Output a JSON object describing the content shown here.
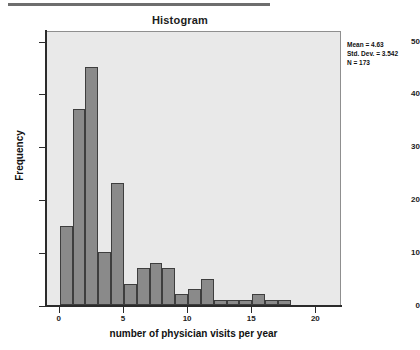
{
  "page": {
    "top_rule": "",
    "bleed_through": [
      "THE ROLE OF THE GROUP OF THE",
      "GROUP",
      "of the patients in the study were",
      "and they were seen in the",
      "clinic at least once during",
      "the year of the survey",
      "PATIENT STUDY RESULTS 2002"
    ]
  },
  "chart_data": {
    "type": "bar",
    "title": "Histogram",
    "xlabel": "number of physician visits per year",
    "ylabel": "Frequency",
    "x": [
      0,
      1,
      2,
      3,
      4,
      5,
      6,
      7,
      8,
      9,
      10,
      11,
      12,
      13,
      14,
      15,
      16,
      17
    ],
    "bin_width": 1,
    "values": [
      15,
      37,
      45,
      10,
      23,
      4,
      7,
      8,
      7,
      2,
      3,
      5,
      1,
      1,
      1,
      2,
      1,
      1
    ],
    "categories": [
      "0",
      "1",
      "2",
      "3",
      "4",
      "5",
      "6",
      "7",
      "8",
      "9",
      "10",
      "11",
      "12",
      "13",
      "14",
      "15",
      "16",
      "17"
    ],
    "xlim": [
      -1,
      22
    ],
    "ylim": [
      0,
      52
    ],
    "xticks": [
      0,
      5,
      10,
      15,
      20
    ],
    "xtick_labels": [
      "0",
      "5",
      "10",
      "15",
      "20"
    ],
    "yticks": [
      0,
      10,
      20,
      30,
      40,
      50
    ],
    "ytick_labels": [
      "0",
      "10",
      "20",
      "30",
      "40",
      "50"
    ],
    "grid": false,
    "legend": "none",
    "bar_color": "#8a8a8a",
    "bar_edge_color": "#3e3e3e",
    "plot_background": "#e9e9e9",
    "annotations": {
      "mean_label": "Mean = 4.63",
      "std_dev_label": "Std. Dev. = 3.542",
      "n_label": "N = 173",
      "position": "top-right"
    }
  }
}
